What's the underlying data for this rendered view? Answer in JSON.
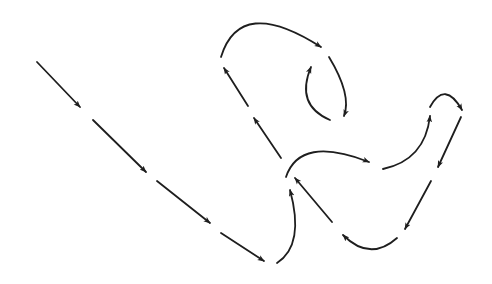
{
  "diagram": {
    "stroke_color": "#1e1e1e",
    "background": "#ffffff",
    "segments": [
      {
        "id": "s1",
        "type": "line",
        "d": "M37,62 L80,107"
      },
      {
        "id": "s2",
        "type": "line",
        "d": "M93,120 L146,172"
      },
      {
        "id": "s3",
        "type": "line",
        "d": "M157,181 L210,223"
      },
      {
        "id": "s4",
        "type": "line",
        "d": "M221,233 L264,261"
      },
      {
        "id": "s5",
        "type": "curve",
        "d": "M277,263 Q305,245 290,190"
      },
      {
        "id": "s6",
        "type": "line",
        "d": "M332,222 L295,178"
      },
      {
        "id": "s7",
        "type": "curve",
        "d": "M286,177 Q300,135 369,162"
      },
      {
        "id": "s8",
        "type": "curve",
        "d": "M383,169 Q425,160 430,116"
      },
      {
        "id": "s9",
        "type": "curve",
        "d": "M430,107 Q445,80 462,110"
      },
      {
        "id": "s10",
        "type": "line",
        "d": "M461,117 L438,167"
      },
      {
        "id": "s11",
        "type": "line",
        "d": "M431,181 L405,229"
      },
      {
        "id": "s12",
        "type": "curve",
        "d": "M397,238 Q370,262 343,235"
      },
      {
        "id": "s13",
        "type": "line",
        "d": "M281,158 L254,118"
      },
      {
        "id": "s14",
        "type": "line",
        "d": "M248,106 L224,68"
      },
      {
        "id": "s15",
        "type": "curve",
        "d": "M221,57 Q240,-5 321,47"
      },
      {
        "id": "s16",
        "type": "curve",
        "d": "M329,57 Q352,95 344,116"
      },
      {
        "id": "s17",
        "type": "curve",
        "d": "M330,120 Q295,105 311,67"
      }
    ]
  }
}
